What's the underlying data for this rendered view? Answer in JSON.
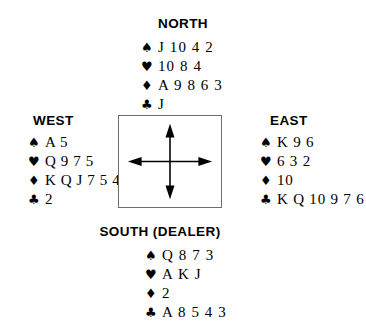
{
  "diagram": {
    "type": "bridge-hand-diagram",
    "background_color": "#ffffff",
    "ink_color": "#000000",
    "box_border_color": "#6e6e6e"
  },
  "labels": {
    "north": "NORTH",
    "west": "WEST",
    "east": "EAST",
    "south": "SOUTH (DEALER)"
  },
  "suit_symbols": {
    "spade": "♠",
    "heart": "♥",
    "diamond": "♦",
    "club": "♣"
  },
  "hands": {
    "north": {
      "seat": "NORTH",
      "spades": "J 10 4 2",
      "hearts": "10 8 4",
      "diamonds": "A 9 8 6 3",
      "clubs": "J"
    },
    "west": {
      "seat": "WEST",
      "spades": "A 5",
      "hearts": "Q 9 7 5",
      "diamonds": "K Q J 7 5 4",
      "clubs": "2"
    },
    "east": {
      "seat": "EAST",
      "spades": "K 9 6",
      "hearts": "6 3 2",
      "diamonds": "10",
      "clubs": "K Q 10 9 7 6"
    },
    "south": {
      "seat": "SOUTH (DEALER)",
      "spades": "Q 8 7 3",
      "hearts": "A K J",
      "diamonds": "2",
      "clubs": "A 8 5 4 3"
    }
  },
  "compass": {
    "name": "four-way-compass-arrows",
    "directions": [
      "north",
      "south",
      "east",
      "west"
    ]
  }
}
